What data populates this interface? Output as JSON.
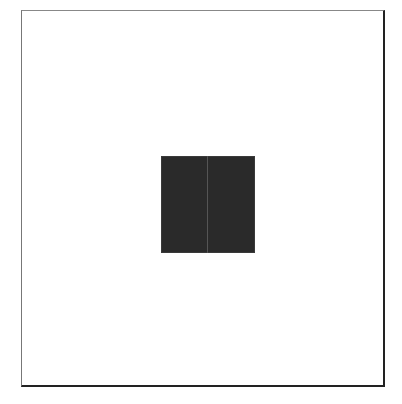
{
  "caption": {
    "text": "",
    "visible": false
  },
  "frame": {
    "border_color": "#222222",
    "background": "#ffffff"
  },
  "figure": {
    "fill": "#2a2a2a",
    "shape": "square",
    "seam": true
  }
}
